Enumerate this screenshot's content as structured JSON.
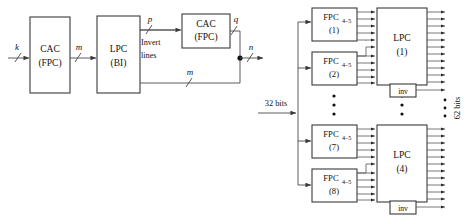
{
  "figure": {
    "left_diagram": {
      "name": "generic-encoder-chain",
      "blocks": [
        {
          "id": "cac1",
          "line1": "CAC",
          "line2": "(FPC)"
        },
        {
          "id": "lpc1",
          "line1": "LPC",
          "line2": "(BI)"
        },
        {
          "id": "cac2",
          "line1": "CAC",
          "line2": "(FPC)"
        }
      ],
      "signals": {
        "input": "k",
        "mid": "m",
        "invert_out": "p",
        "cac2_out": "q",
        "bypass": "m",
        "output": "n"
      },
      "invert_label_line1": "Invert",
      "invert_label_line2": "lines"
    },
    "right_diagram": {
      "name": "parallel-fpc-lpc-array",
      "input_label": "32 bits",
      "output_label": "62 bits",
      "fpc_base": "FPC",
      "fpc_subscript": "4–5",
      "fpc_blocks": [
        {
          "index": "(1)"
        },
        {
          "index": "(2)"
        },
        {
          "index": "(7)"
        },
        {
          "index": "(8)"
        }
      ],
      "lpc_base": "LPC",
      "lpc_blocks": [
        {
          "index": "(1)"
        },
        {
          "index": "(4)"
        }
      ],
      "inv_label": "inv",
      "ellipsis_marker": "•"
    },
    "colors": {
      "line": "#4a4a4a",
      "block_stroke": "#3a3a3a",
      "text": "#111111",
      "background": "#ffffff"
    }
  }
}
